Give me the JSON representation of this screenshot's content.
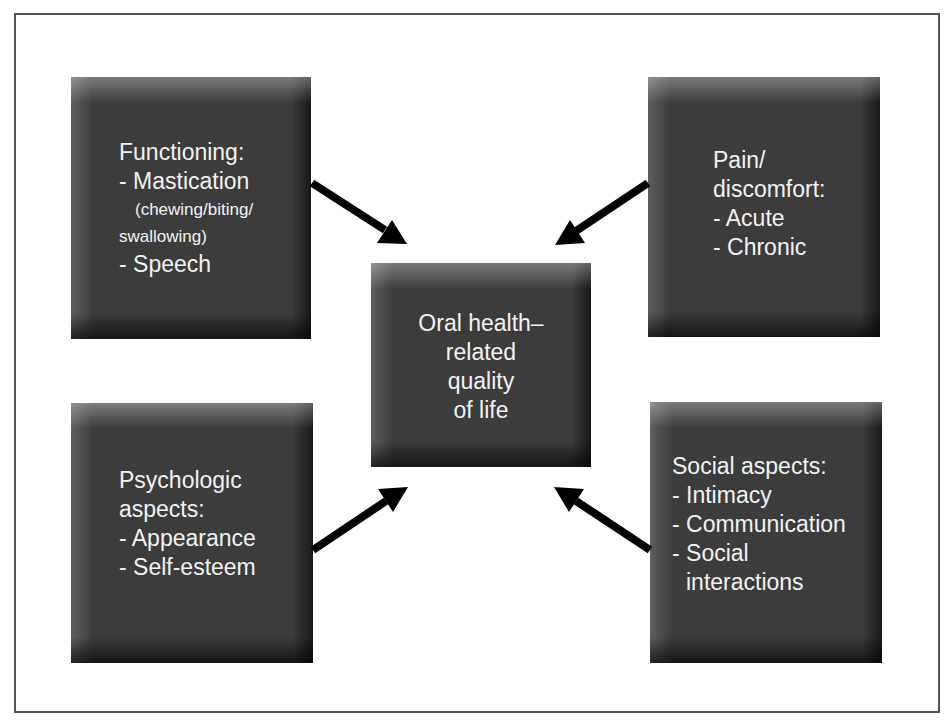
{
  "diagram": {
    "center": {
      "lines": [
        "Oral health–",
        "related",
        "quality",
        "of life"
      ]
    },
    "functioning": {
      "title": "Functioning:",
      "item1": "- Mastication",
      "item1_detail1": "(chewing/biting/",
      "item1_detail2": "swallowing)",
      "item2": "- Speech"
    },
    "pain": {
      "title1": "Pain/",
      "title2": "discomfort:",
      "item1": "- Acute",
      "item2": "- Chronic"
    },
    "psychologic": {
      "title1": "Psychologic",
      "title2": "aspects:",
      "item1": "- Appearance",
      "item2": "- Self-esteem"
    },
    "social": {
      "title": "Social aspects:",
      "item1": "- Intimacy",
      "item2": "- Communication",
      "item3": "- Social",
      "item3b": "interactions"
    },
    "colors": {
      "box_fill": "#3c3c3c",
      "text": "#f2f2f2",
      "arrow": "#000000",
      "frame": "#555555"
    }
  }
}
